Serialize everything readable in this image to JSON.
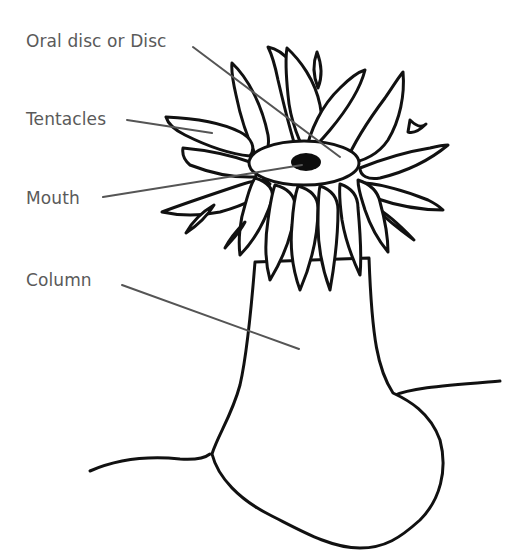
{
  "diagram": {
    "labels": [
      {
        "id": "oral-disc",
        "text": "Oral disc or Disc"
      },
      {
        "id": "tentacles",
        "text": "Tentacles"
      },
      {
        "id": "mouth",
        "text": "Mouth"
      },
      {
        "id": "column",
        "text": "Column"
      }
    ],
    "colors": {
      "outline": "#111111",
      "label_text": "#5a5a5a",
      "leader_line": "#555555",
      "background": "#ffffff"
    }
  }
}
